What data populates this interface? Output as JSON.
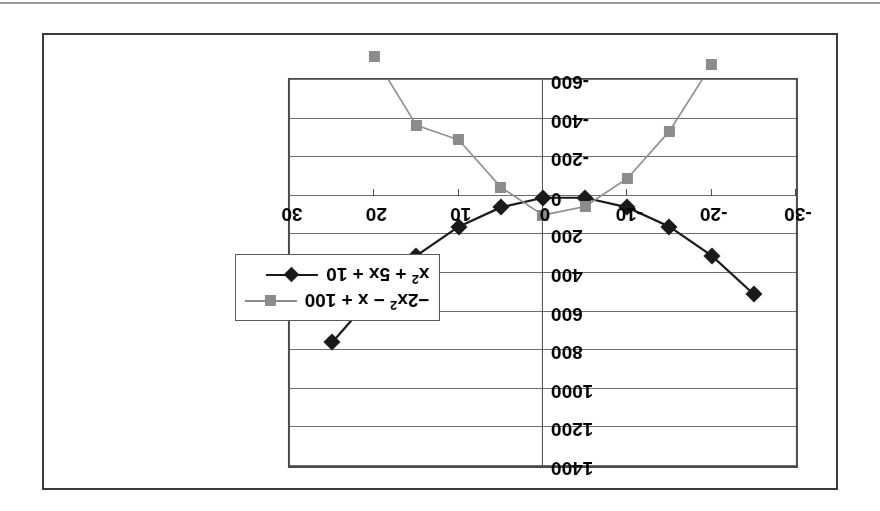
{
  "page": {
    "background": "#ffffff",
    "frame_color": "#3a3a3a",
    "rotation_degrees": 180
  },
  "legend": {
    "position": "upper-left",
    "entries": [
      {
        "label": "−2x² − x + 100",
        "marker": "square-marker",
        "color": "#8c8c8c"
      },
      {
        "label": "x² + 5x + 10",
        "marker": "diamond-marker",
        "color": "#1a1a1a"
      }
    ]
  },
  "chart_data": {
    "type": "line",
    "title": "",
    "subtitle": "",
    "xlabel": "",
    "ylabel": "",
    "xlim": [
      -30,
      30
    ],
    "ylim": [
      -600,
      1400
    ],
    "xticks": [
      -30,
      -20,
      -10,
      0,
      10,
      20,
      30
    ],
    "yticks": [
      -600,
      -400,
      -200,
      0,
      200,
      400,
      600,
      800,
      1000,
      1200,
      1400
    ],
    "xtick_labels": [
      "-30",
      "-20",
      "-10",
      "0",
      "10",
      "20",
      "30"
    ],
    "ytick_labels": [
      "-600",
      "-400",
      "-200",
      "0",
      "200",
      "400",
      "600",
      "800",
      "1000",
      "1200",
      "1400"
    ],
    "grid": true,
    "grid_axis": "y",
    "legend_position": "upper-left",
    "x": [
      -25,
      -20,
      -15,
      -10,
      -5,
      0,
      5,
      10,
      15,
      20,
      25
    ],
    "series": [
      {
        "name": "x² + 5x + 10",
        "marker": "diamond",
        "color": "#1a1a1a",
        "values": [
          510,
          310,
          160,
          60,
          10,
          10,
          60,
          160,
          310,
          510,
          760
        ]
      },
      {
        "name": "−2x² − x + 100",
        "marker": "square",
        "color": "#8c8c8c",
        "values": [
          -1125,
          -680,
          -335,
          -90,
          55,
          100,
          -45,
          -290,
          -365,
          -720,
          -1175
        ]
      }
    ]
  }
}
